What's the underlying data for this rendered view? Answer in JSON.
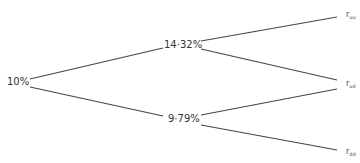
{
  "diagram": {
    "type": "binomial-interest-rate-tree",
    "line_color": "#444444",
    "nodes": {
      "root": {
        "label": "10%"
      },
      "up": {
        "label": "14·32%"
      },
      "down": {
        "label": "9·79%"
      },
      "uu": {
        "label": "r",
        "sub": "uu"
      },
      "ud": {
        "label": "r",
        "sub": "ud"
      },
      "dd": {
        "label": "r",
        "sub": "dd"
      }
    },
    "edges": [
      {
        "from": "root",
        "to": "up"
      },
      {
        "from": "root",
        "to": "down"
      },
      {
        "from": "up",
        "to": "uu"
      },
      {
        "from": "up",
        "to": "ud"
      },
      {
        "from": "down",
        "to": "ud"
      },
      {
        "from": "down",
        "to": "dd"
      }
    ]
  }
}
